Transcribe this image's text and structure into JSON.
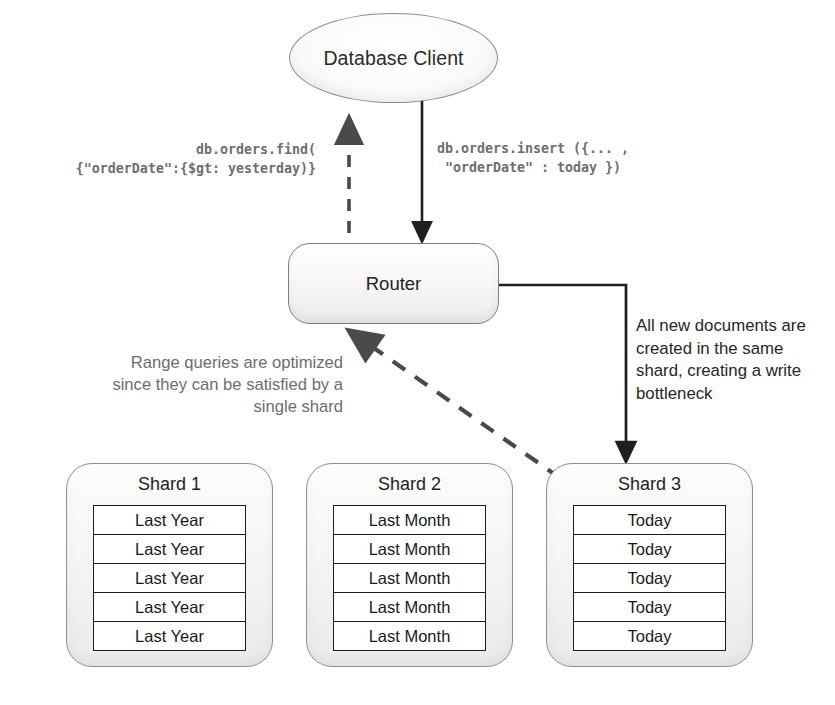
{
  "diagram": {
    "client": {
      "label": "Database Client"
    },
    "router": {
      "label": "Router"
    },
    "queries": {
      "find": "db.orders.find(\n{\"orderDate\":{$gt: yesterday)}",
      "insert": "db.orders.insert ({... ,\n \"orderDate\" : today })"
    },
    "annotations": {
      "left": "Range queries are optimized since they can be satisfied by a single shard",
      "right": "All new documents are created in the same shard, creating a write bottleneck"
    },
    "shards": [
      {
        "title": "Shard 1",
        "rows": [
          "Last Year",
          "Last Year",
          "Last Year",
          "Last Year",
          "Last Year"
        ]
      },
      {
        "title": "Shard 2",
        "rows": [
          "Last Month",
          "Last Month",
          "Last Month",
          "Last Month",
          "Last Month"
        ]
      },
      {
        "title": "Shard 3",
        "rows": [
          "Today",
          "Today",
          "Today",
          "Today",
          "Today"
        ]
      }
    ],
    "edges": [
      {
        "name": "client-to-router-insert",
        "style": "solid",
        "direction": "down"
      },
      {
        "name": "router-to-client-find",
        "style": "dashed",
        "direction": "up"
      },
      {
        "name": "router-to-shard3-write",
        "style": "solid",
        "direction": "down"
      },
      {
        "name": "shard3-to-router-read",
        "style": "dashed",
        "direction": "up-left"
      }
    ],
    "colors": {
      "node_stroke": "#8d8d8d",
      "edge_solid": "#1f1f1f",
      "edge_dashed": "#4a4a4a",
      "annotation_muted": "#6d6d6d",
      "annotation_dark": "#262626",
      "table_stroke": "#1c1c1c"
    }
  }
}
